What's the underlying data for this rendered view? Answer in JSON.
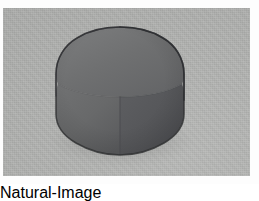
{
  "scene": {
    "title": "Rounded cube solid on gray backdrop",
    "kind": "3d-render",
    "canvas": {
      "width": 259,
      "height": 184
    },
    "frame": {
      "label": "white page margin",
      "color": "#fdfdfd",
      "inset_px": 3
    },
    "backdrop": {
      "label": "gray backdrop plate",
      "color": "#b0b1af",
      "x": 3,
      "y": 8,
      "width": 247,
      "height": 168,
      "texture": "fine compression noise"
    },
    "object": {
      "label": "rounded cube",
      "alt_names": [
        "superellipsoid",
        "squircle cube",
        "hexagonal silhouette solid"
      ],
      "silhouette": "hexagon with rounded corners",
      "bounds": {
        "left": 56,
        "top": 27,
        "right": 184,
        "bottom": 155
      },
      "center_vertex": {
        "x": 120,
        "y": 96
      },
      "outline_color": "#2f3031",
      "faces": [
        {
          "name": "top-face",
          "label": "top face",
          "color": "#6f7071",
          "shading": "mid gray, brightest toward upper-left"
        },
        {
          "name": "left-face",
          "label": "left face",
          "color": "#68696a",
          "shading": "slightly lighter, gradient to darker bottom"
        },
        {
          "name": "right-face",
          "label": "right face",
          "color": "#55565a",
          "shading": "darkest, in shadow"
        }
      ],
      "shadow": {
        "label": "contact shadow",
        "color": "rgba(0,0,0,0.16)"
      }
    }
  }
}
